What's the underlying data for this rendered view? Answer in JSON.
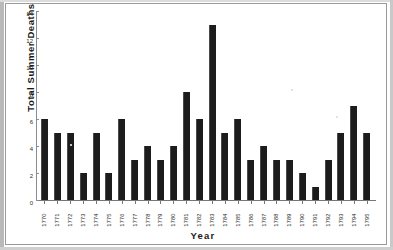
{
  "chart_data": {
    "type": "bar",
    "title": "",
    "xlabel": "Year",
    "ylabel": "Total Summer Deaths",
    "categories": [
      "1770",
      "1771",
      "1772",
      "1773",
      "1774",
      "1775",
      "1776",
      "1777",
      "1778",
      "1779",
      "1780",
      "1781",
      "1782",
      "1783",
      "1784",
      "1785",
      "1786",
      "1787",
      "1788",
      "1789",
      "1790",
      "1791",
      "1792",
      "1793",
      "1794",
      "1795"
    ],
    "values": [
      6,
      5,
      5,
      2,
      5,
      2,
      6,
      3,
      4,
      3,
      4,
      8,
      6,
      13,
      5,
      6,
      3,
      4,
      3,
      3,
      2,
      1,
      3,
      5,
      7,
      5
    ],
    "ylim": [
      0,
      14
    ],
    "yticks": [
      0,
      2,
      4,
      6,
      8,
      10,
      12,
      14
    ],
    "ytick_labels": [
      "0",
      "2",
      "4",
      "6",
      "8",
      "10",
      "12",
      "14"
    ],
    "grid": false,
    "legend": null,
    "bar_color": "#1c1c1c",
    "axis_color": "#777777",
    "background": "#ffffff"
  }
}
